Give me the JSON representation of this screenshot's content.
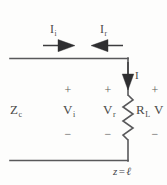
{
  "figure": {
    "type": "circuit-diagram",
    "width": 167,
    "height": 185,
    "background_color": "#fdfdfc",
    "stroke_color": "#58585a",
    "text_color": "#4a4a48"
  },
  "labels": {
    "incident_current": {
      "symbol": "I",
      "subscript": "i"
    },
    "reflected_current": {
      "symbol": "I",
      "subscript": "r"
    },
    "load_current": {
      "symbol": "I",
      "subscript": ""
    },
    "characteristic_impedance": {
      "symbol": "Z",
      "subscript": "c"
    },
    "incident_voltage": {
      "symbol": "V",
      "subscript": "i"
    },
    "reflected_voltage": {
      "symbol": "V",
      "subscript": "r"
    },
    "load_resistance": {
      "symbol": "R",
      "subscript": "L"
    },
    "load_voltage": {
      "symbol": "V",
      "subscript": ""
    }
  },
  "polarity": {
    "plus": "+",
    "minus": "−",
    "incident_plus": "+",
    "incident_minus": "−",
    "reflected_plus": "+",
    "reflected_minus": "−",
    "load_plus": "+",
    "load_minus": "−"
  },
  "position_marker": {
    "variable": "z",
    "equals": "=",
    "value": "ℓ",
    "full_text": "z = ℓ"
  },
  "arrows": {
    "incident_direction": "right",
    "reflected_direction": "left",
    "load_current_direction": "down"
  },
  "components": {
    "resistor": {
      "name": "load-resistor",
      "style": "zigzag",
      "label_ref": "load_resistance"
    },
    "top_conductor": {
      "name": "top-transmission-line"
    },
    "bottom_conductor": {
      "name": "bottom-transmission-line"
    },
    "right_conductor": {
      "name": "load-branch"
    }
  }
}
